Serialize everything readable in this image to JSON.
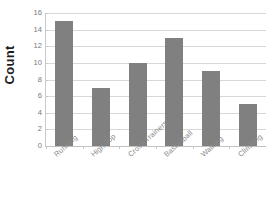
{
  "chart_data": {
    "type": "bar",
    "title": "",
    "xlabel": "",
    "ylabel": "Count",
    "categories": [
      "Running",
      "High Top",
      "Cross Trainers",
      "Basketball",
      "Walking",
      "Climbing"
    ],
    "values": [
      15,
      7,
      10,
      13,
      9,
      5
    ],
    "ylim": [
      0,
      16
    ],
    "y_ticks": [
      0,
      2,
      4,
      6,
      8,
      10,
      12,
      14,
      16
    ],
    "y_tick_labels": [
      "0",
      "2",
      "4",
      "6",
      "8",
      "10",
      "12",
      "14",
      "16"
    ],
    "grid": true,
    "legend": false,
    "bar_color": "#808080",
    "gridline_color": "#d8d8d8",
    "background_color": "#ffffff",
    "label_color": "#8a8a8a",
    "axis_title_color": "#1d1d1d",
    "x_label_rotation": -42
  },
  "axis_titles": {
    "y": "Count"
  },
  "title_text": ""
}
